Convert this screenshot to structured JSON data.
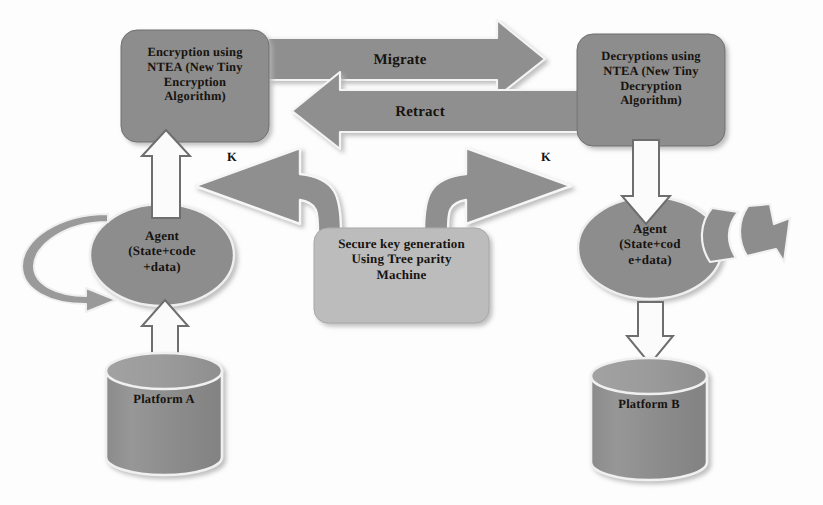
{
  "diagram": {
    "colors": {
      "node_fill": "#8f8f8f",
      "node_fill_light": "#b9b9b9",
      "arrow_fill": "#8f8f8f",
      "arrow_outline": "#f2f2f2",
      "hollow_arrow_fill": "#fbfbfb",
      "hollow_arrow_stroke": "#6d6d6d",
      "text": "#16130f",
      "shadow": "#c9c9c9",
      "background": "#fdfdfd"
    },
    "nodes": {
      "encryption_box": {
        "lines": [
          "Encryption using",
          "NTEA (New Tiny",
          "Encryption",
          "Algorithm)"
        ]
      },
      "decryption_box": {
        "lines": [
          "Decryptions using",
          "NTEA (New Tiny",
          "Decryption",
          "Algorithm)"
        ]
      },
      "key_generation_box": {
        "lines": [
          "Secure key generation",
          "Using Tree parity",
          "Machine"
        ]
      },
      "agent_left": {
        "lines": [
          "Agent",
          "(State+code",
          "+data)"
        ]
      },
      "agent_right": {
        "lines": [
          "Agent",
          "(State+cod",
          "e+data)"
        ]
      },
      "platform_a": {
        "label": "Platform A"
      },
      "platform_b": {
        "label": "Platform B"
      }
    },
    "edges": {
      "migrate": {
        "label": "Migrate",
        "direction": "left-to-right",
        "from": "encryption_box",
        "to": "decryption_box"
      },
      "retract": {
        "label": "Retract",
        "direction": "right-to-left",
        "from": "decryption_box",
        "to": "encryption_box"
      },
      "key_to_encryption": {
        "label": "K",
        "direction": "up-left",
        "from": "key_generation_box",
        "to": "encryption_box"
      },
      "key_to_decryption": {
        "label": "K",
        "direction": "up-right",
        "from": "key_generation_box",
        "to": "decryption_box"
      },
      "agent_left_to_encryption": {
        "label": "",
        "direction": "up",
        "from": "agent_left",
        "to": "encryption_box"
      },
      "decryption_to_agent_right": {
        "label": "",
        "direction": "down",
        "from": "decryption_box",
        "to": "agent_right"
      },
      "platform_a_to_agent_left": {
        "label": "",
        "direction": "up",
        "from": "platform_a",
        "to": "agent_left"
      },
      "agent_right_to_platform_b": {
        "label": "",
        "direction": "down",
        "from": "agent_right",
        "to": "platform_b"
      },
      "agent_left_self_loop": {
        "label": "",
        "direction": "loop",
        "from": "agent_left",
        "to": "agent_left"
      },
      "agent_right_bent_arrow": {
        "label": "",
        "direction": "right",
        "from": "agent_right",
        "to": "agent_right"
      }
    }
  }
}
